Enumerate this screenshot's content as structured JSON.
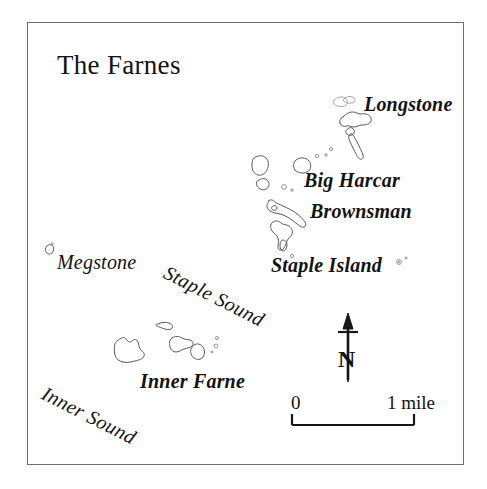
{
  "map": {
    "title": "The Farnes",
    "frame_color": "#6f6f6f",
    "background_color": "#ffffff",
    "ink_color": "#171717",
    "coastline_color": "#5a5a5a"
  },
  "labels": {
    "islands": [
      {
        "name": "longstone",
        "text": "Longstone"
      },
      {
        "name": "big-harcar",
        "text": "Big Harcar"
      },
      {
        "name": "brownsman",
        "text": "Brownsman"
      },
      {
        "name": "staple-island",
        "text": "Staple Island"
      },
      {
        "name": "megstone",
        "text": "Megstone"
      },
      {
        "name": "inner-farne",
        "text": "Inner Farne"
      }
    ],
    "waters": [
      {
        "name": "staple-sound",
        "text": "Staple Sound"
      },
      {
        "name": "inner-sound",
        "text": "Inner Sound"
      }
    ]
  },
  "compass": {
    "letter": "N",
    "icon": "north-arrow-icon"
  },
  "scale_bar": {
    "start_label": "0",
    "end_label": "1 mile",
    "unit": "mile",
    "length_miles": 1,
    "icon": "scale-bar-icon"
  }
}
